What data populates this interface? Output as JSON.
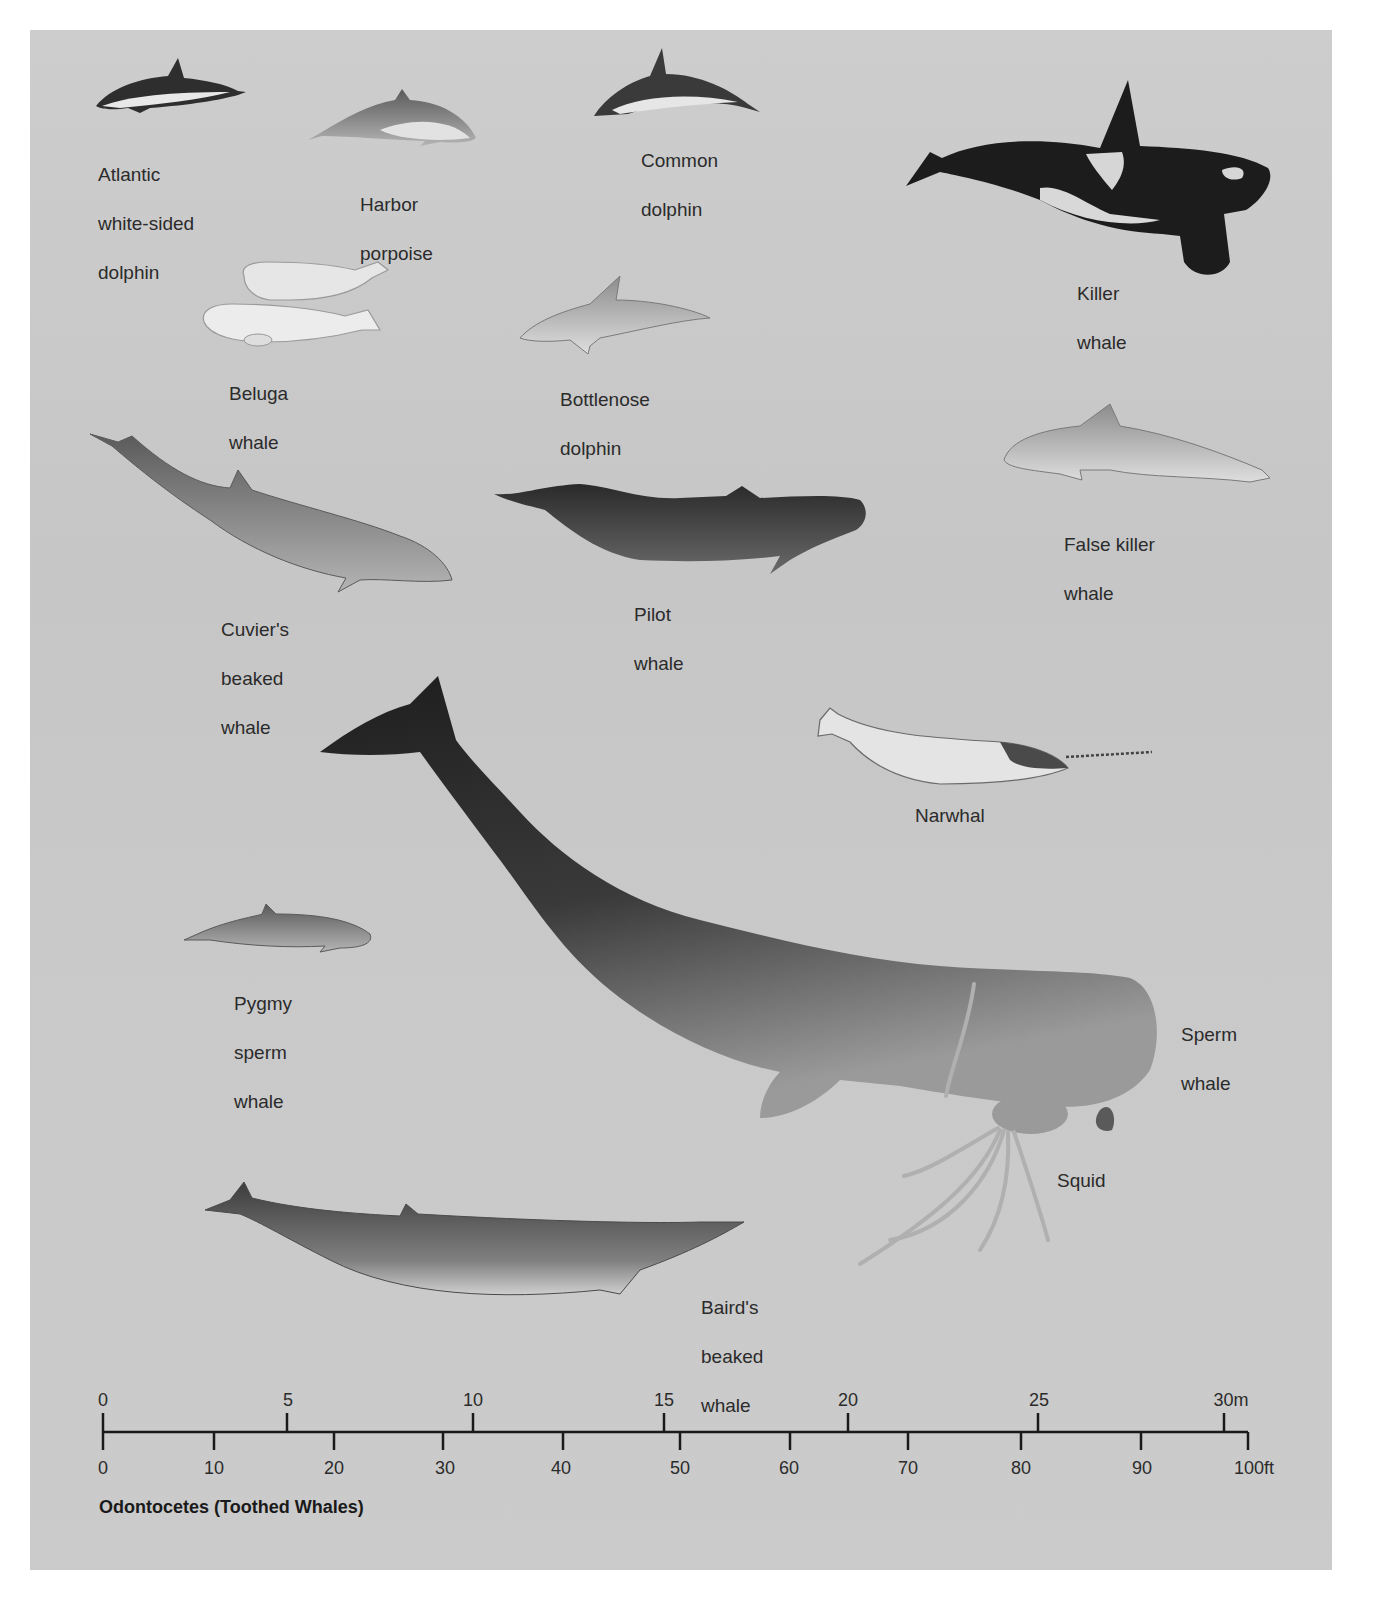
{
  "figure": {
    "title": "Odontocetes (Toothed Whales)",
    "background_color": "#c9c9c9",
    "page_color": "#ffffff",
    "text_color": "#2b2b2b"
  },
  "species": [
    {
      "id": "atlantic-white-sided-dolphin",
      "label_lines": [
        "Atlantic",
        "white-sided",
        "dolphin"
      ]
    },
    {
      "id": "harbor-porpoise",
      "label_lines": [
        "Harbor",
        "porpoise"
      ]
    },
    {
      "id": "common-dolphin",
      "label_lines": [
        "Common",
        "dolphin"
      ]
    },
    {
      "id": "killer-whale",
      "label_lines": [
        "Killer",
        "whale"
      ]
    },
    {
      "id": "beluga-whale",
      "label_lines": [
        "Beluga",
        "whale"
      ]
    },
    {
      "id": "bottlenose-dolphin",
      "label_lines": [
        "Bottlenose",
        "dolphin"
      ]
    },
    {
      "id": "cuviers-beaked-whale",
      "label_lines": [
        "Cuvier's",
        "beaked",
        "whale"
      ]
    },
    {
      "id": "pilot-whale",
      "label_lines": [
        "Pilot",
        "whale"
      ]
    },
    {
      "id": "false-killer-whale",
      "label_lines": [
        "False killer",
        "whale"
      ]
    },
    {
      "id": "narwhal",
      "label_lines": [
        "Narwhal"
      ]
    },
    {
      "id": "pygmy-sperm-whale",
      "label_lines": [
        "Pygmy",
        "sperm",
        "whale"
      ]
    },
    {
      "id": "sperm-whale",
      "label_lines": [
        "Sperm",
        "whale"
      ]
    },
    {
      "id": "squid",
      "label_lines": [
        "Squid"
      ]
    },
    {
      "id": "bairds-beaked-whale",
      "label_lines": [
        "Baird's",
        "beaked",
        "whale"
      ]
    }
  ],
  "scale": {
    "meters": {
      "ticks": [
        "0",
        "5",
        "10",
        "15",
        "20",
        "25",
        "30m"
      ]
    },
    "feet": {
      "ticks": [
        "0",
        "10",
        "20",
        "30",
        "40",
        "50",
        "60",
        "70",
        "80",
        "90",
        "100ft"
      ]
    }
  }
}
